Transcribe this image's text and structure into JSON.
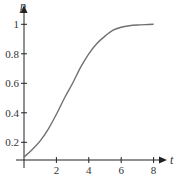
{
  "chart_data": {
    "type": "line",
    "title": "",
    "xlabel": "t",
    "ylabel": "p",
    "xlim": [
      0,
      8.5
    ],
    "ylim": [
      0.07,
      1.1
    ],
    "grid": false,
    "legend": null,
    "x_ticks": [
      {
        "value": 2,
        "label": "2"
      },
      {
        "value": 4,
        "label": "4"
      },
      {
        "value": 6,
        "label": "6"
      },
      {
        "value": 8,
        "label": "8"
      }
    ],
    "y_ticks": [
      {
        "value": 0.2,
        "label": "0.2"
      },
      {
        "value": 0.4,
        "label": "0.4"
      },
      {
        "value": 0.6,
        "label": "0.6"
      },
      {
        "value": 0.8,
        "label": "0.8"
      },
      {
        "value": 1,
        "label": "1"
      }
    ],
    "series": [
      {
        "name": "p(t)",
        "x": [
          0,
          0.5,
          1,
          1.5,
          2,
          2.5,
          3,
          3.5,
          4,
          4.5,
          5,
          5.5,
          6,
          6.5,
          7,
          7.5,
          8
        ],
        "y": [
          0.1,
          0.15,
          0.21,
          0.29,
          0.39,
          0.5,
          0.6,
          0.71,
          0.8,
          0.87,
          0.92,
          0.96,
          0.98,
          0.99,
          0.995,
          0.998,
          1.0
        ]
      }
    ],
    "colors": {
      "axis": "#222222",
      "curve": "#707070",
      "text": "#333333"
    }
  }
}
